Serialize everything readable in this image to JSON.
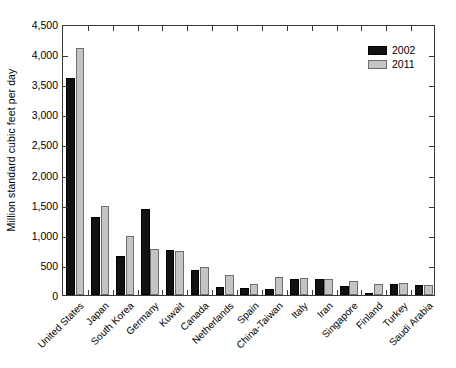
{
  "chart_data": {
    "type": "bar",
    "title": "",
    "xlabel": "",
    "ylabel": "Million standard cubic feet per day",
    "ylim": [
      0,
      4500
    ],
    "yticks": [
      0,
      500,
      1000,
      1500,
      2000,
      2500,
      3000,
      3500,
      4000,
      4500
    ],
    "ytick_labels": [
      "0",
      "500",
      "1,000",
      "1,500",
      "2,000",
      "2,500",
      "3,000",
      "3,500",
      "4,000",
      "4,500"
    ],
    "grid": false,
    "legend_position": "top-right",
    "categories": [
      "United States",
      "Japan",
      "South Korea",
      "Germany",
      "Kuwait",
      "Canada",
      "Netherlands",
      "Spain",
      "China-Taiwan",
      "Italy",
      "Iran",
      "Singapore",
      "Finland",
      "Turkey",
      "Saudi Arabia"
    ],
    "series": [
      {
        "name": "2002",
        "color": "#111111",
        "values": [
          3600,
          1300,
          640,
          1430,
          740,
          420,
          130,
          110,
          100,
          270,
          260,
          150,
          20,
          190,
          170
        ]
      },
      {
        "name": "2011",
        "color": "#c4c4c4",
        "values": [
          4110,
          1470,
          980,
          760,
          730,
          470,
          340,
          190,
          300,
          290,
          260,
          230,
          180,
          200,
          170
        ]
      }
    ]
  },
  "legend": {
    "entries": [
      {
        "label": "2002",
        "swatch": "black-swatch"
      },
      {
        "label": "2011",
        "swatch": "gray-swatch"
      }
    ]
  }
}
